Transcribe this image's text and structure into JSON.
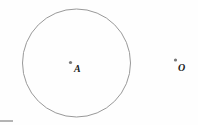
{
  "figure": {
    "background_color": "#fefefe",
    "width": 198,
    "height": 125,
    "stroke_color": "#999999",
    "point_color": "#777777",
    "label_color": "#1a1a1a",
    "shapes": [
      {
        "name": "circle",
        "type": "circle",
        "cx": 76.5,
        "cy": 63,
        "r": 54,
        "fill": "none",
        "stroke": "#999999",
        "stroke_width": 1
      }
    ],
    "points": [
      {
        "name": "point-a",
        "label": "A",
        "x": 70.5,
        "y": 62.5,
        "label_x": 74,
        "label_y": 64,
        "dot_radius": 1.6,
        "dot_color": "#777777"
      },
      {
        "name": "point-o",
        "label": "O",
        "x": 175.5,
        "y": 60,
        "label_x": 178,
        "label_y": 63,
        "dot_radius": 1.6,
        "dot_color": "#777777"
      }
    ],
    "artifacts": [
      {
        "name": "bottom-left-mark",
        "x": 0,
        "y": 120,
        "width": 13,
        "height": 2,
        "color": "#b4b4b4"
      }
    ]
  }
}
